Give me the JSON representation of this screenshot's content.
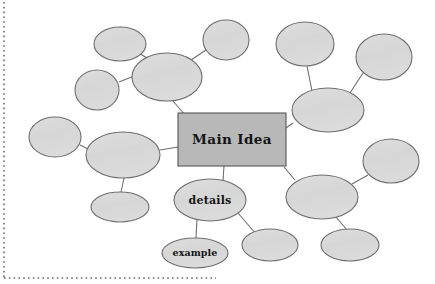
{
  "document": {
    "type": "concept-map-worksheet",
    "background_color": "#ffffff",
    "border": {
      "name": "dotted-page-border",
      "style": "dotted",
      "color": "#6b6b6b",
      "left": {
        "x": 4,
        "y1": 2,
        "y2": 278
      },
      "bottom": {
        "y": 278,
        "x1": 4,
        "x2": 216
      }
    }
  },
  "palette": {
    "node_fill": "#d9d9d9",
    "node_stroke": "#6e6e6e",
    "box_fill": "#b8b8b8",
    "box_stroke": "#575757",
    "connector": "#6e6e6e",
    "text": "#141414"
  },
  "nodes": [
    {
      "id": "main-idea",
      "label": "Main Idea",
      "shape": "rect",
      "x": 178,
      "y": 113,
      "w": 108,
      "h": 53,
      "label_size": "main"
    },
    {
      "id": "details",
      "label": "details",
      "shape": "ellipse",
      "cx": 210,
      "cy": 200,
      "rx": 36,
      "ry": 21,
      "label_size": "details"
    },
    {
      "id": "example",
      "label": "example",
      "shape": "ellipse",
      "cx": 195,
      "cy": 253,
      "rx": 33,
      "ry": 15,
      "label_size": "example"
    },
    {
      "id": "branch-nw-big",
      "label": "",
      "shape": "ellipse",
      "cx": 167,
      "cy": 77,
      "rx": 35,
      "ry": 24
    },
    {
      "id": "branch-nw-top",
      "label": "",
      "shape": "ellipse",
      "cx": 120,
      "cy": 44,
      "rx": 26,
      "ry": 17
    },
    {
      "id": "branch-nw-left",
      "label": "",
      "shape": "ellipse",
      "cx": 97,
      "cy": 90,
      "rx": 22,
      "ry": 20
    },
    {
      "id": "branch-n-mid",
      "label": "",
      "shape": "ellipse",
      "cx": 226,
      "cy": 40,
      "rx": 23,
      "ry": 20
    },
    {
      "id": "branch-ne-big",
      "label": "",
      "shape": "ellipse",
      "cx": 328,
      "cy": 110,
      "rx": 36,
      "ry": 22
    },
    {
      "id": "branch-ne-top",
      "label": "",
      "shape": "ellipse",
      "cx": 305,
      "cy": 44,
      "rx": 29,
      "ry": 22
    },
    {
      "id": "branch-ne-right",
      "label": "",
      "shape": "ellipse",
      "cx": 384,
      "cy": 57,
      "rx": 28,
      "ry": 23
    },
    {
      "id": "branch-w-big",
      "label": "",
      "shape": "ellipse",
      "cx": 123,
      "cy": 155,
      "rx": 37,
      "ry": 23
    },
    {
      "id": "branch-w-left",
      "label": "",
      "shape": "ellipse",
      "cx": 55,
      "cy": 137,
      "rx": 26,
      "ry": 20
    },
    {
      "id": "branch-w-bottom",
      "label": "",
      "shape": "ellipse",
      "cx": 120,
      "cy": 207,
      "rx": 29,
      "ry": 15
    },
    {
      "id": "branch-se-big",
      "label": "",
      "shape": "ellipse",
      "cx": 322,
      "cy": 197,
      "rx": 36,
      "ry": 22
    },
    {
      "id": "branch-se-right",
      "label": "",
      "shape": "ellipse",
      "cx": 391,
      "cy": 161,
      "rx": 28,
      "ry": 22
    },
    {
      "id": "branch-se-bottom",
      "label": "",
      "shape": "ellipse",
      "cx": 350,
      "cy": 245,
      "rx": 29,
      "ry": 16
    },
    {
      "id": "branch-s-mid",
      "label": "",
      "shape": "ellipse",
      "cx": 270,
      "cy": 245,
      "rx": 28,
      "ry": 16
    }
  ],
  "connectors": [
    {
      "from": "branch-nw-big",
      "to": "main-idea",
      "x1": 173,
      "y1": 101,
      "x2": 186,
      "y2": 116
    },
    {
      "from": "branch-nw-top",
      "to": "branch-nw-big",
      "x1": 139,
      "y1": 53,
      "x2": 150,
      "y2": 60
    },
    {
      "from": "branch-nw-left",
      "to": "branch-nw-big",
      "x1": 119,
      "y1": 82,
      "x2": 134,
      "y2": 76
    },
    {
      "from": "branch-n-mid",
      "to": "branch-nw-big",
      "x1": 206,
      "y1": 50,
      "x2": 191,
      "y2": 60
    },
    {
      "from": "branch-ne-top",
      "to": "branch-ne-big",
      "x1": 307,
      "y1": 66,
      "x2": 312,
      "y2": 91
    },
    {
      "from": "branch-ne-right",
      "to": "branch-ne-big",
      "x1": 363,
      "y1": 73,
      "x2": 350,
      "y2": 93
    },
    {
      "from": "branch-ne-big",
      "to": "main-idea",
      "x1": 293,
      "y1": 123,
      "x2": 286,
      "y2": 128
    },
    {
      "from": "branch-w-big",
      "to": "main-idea",
      "x1": 160,
      "y1": 150,
      "x2": 178,
      "y2": 147
    },
    {
      "from": "branch-w-left",
      "to": "branch-w-big",
      "x1": 80,
      "y1": 145,
      "x2": 90,
      "y2": 150
    },
    {
      "from": "branch-w-big",
      "to": "branch-w-bottom",
      "x1": 124,
      "y1": 178,
      "x2": 121,
      "y2": 192
    },
    {
      "from": "main-idea",
      "to": "details",
      "x1": 224,
      "y1": 166,
      "x2": 223,
      "y2": 181
    },
    {
      "from": "details",
      "to": "example",
      "x1": 197,
      "y1": 219,
      "x2": 196,
      "y2": 238
    },
    {
      "from": "details",
      "to": "branch-s-mid",
      "x1": 238,
      "y1": 213,
      "x2": 256,
      "y2": 234
    },
    {
      "from": "main-idea",
      "to": "branch-se-big",
      "x1": 284,
      "y1": 167,
      "x2": 295,
      "y2": 180
    },
    {
      "from": "branch-se-big",
      "to": "branch-se-right",
      "x1": 352,
      "y1": 184,
      "x2": 368,
      "y2": 175
    },
    {
      "from": "branch-se-big",
      "to": "branch-se-bottom",
      "x1": 336,
      "y1": 217,
      "x2": 347,
      "y2": 230
    }
  ]
}
